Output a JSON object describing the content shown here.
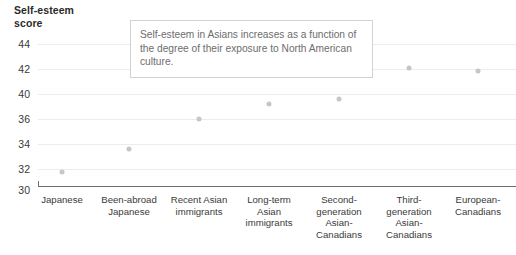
{
  "chart_data": {
    "type": "scatter",
    "title": "Self-esteem\nscore",
    "ylabel": "Self-esteem score",
    "xlabel": "",
    "categories": [
      "Japanese",
      "Been-abroad\nJapanese",
      "Recent Asian\nimmigrants",
      "Long-term\nAsian\nimmigrants",
      "Second-\ngeneration\nAsian-\nCanadians",
      "Third-\ngeneration\nAsian-\nCanadians",
      "European-\nCanadians"
    ],
    "values": [
      31,
      33.5,
      36,
      36.8,
      39.3,
      42,
      41.7
    ],
    "ytick_labels": [
      "44",
      "42",
      "40",
      "36",
      "34",
      "32",
      "30"
    ],
    "ylim": [
      30,
      44
    ],
    "grid": true,
    "legend": "none",
    "annotations": [
      "Self-esteem in Asians increases as a function of the degree of their exposure to North American culture."
    ],
    "colors": {
      "point": "#c6c6c6",
      "gridline": "#ececec",
      "axis": "#6e6e6e",
      "text": "#3a3a3a",
      "annotation_text": "#6d6d6d",
      "annotation_border": "#d2d2d2",
      "background": "#ffffff"
    }
  },
  "layout": {
    "ytick_y": [
      44,
      69,
      94,
      119,
      144,
      169,
      190
    ],
    "point_xy": [
      {
        "x": 62,
        "y": 172
      },
      {
        "x": 129,
        "y": 149
      },
      {
        "x": 199,
        "y": 119
      },
      {
        "x": 269,
        "y": 104
      },
      {
        "x": 339,
        "y": 99
      },
      {
        "x": 409,
        "y": 68
      },
      {
        "x": 478,
        "y": 71
      }
    ],
    "category_x": [
      62,
      129,
      199,
      269,
      339,
      409,
      478
    ]
  }
}
